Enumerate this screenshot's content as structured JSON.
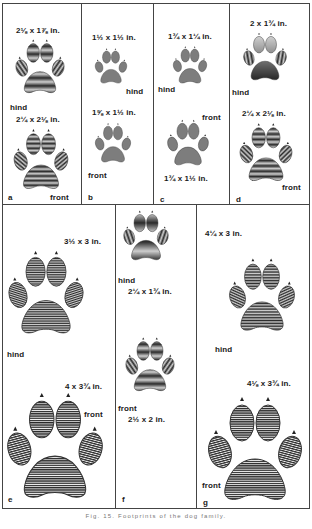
{
  "figure": {
    "caption": "Fig. 15.   Footprints of the dog family.",
    "panels": [
      {
        "id": "a",
        "letter": "a",
        "tracks": [
          {
            "which": "hind",
            "size": "2⅛ x 1⅞ in."
          },
          {
            "which": "front",
            "size": "2¼ x 2⅛ in."
          }
        ]
      },
      {
        "id": "b",
        "letter": "b",
        "tracks": [
          {
            "which": "hind",
            "size": "1½ x 1½ in."
          },
          {
            "which": "front",
            "size": "1⅝ x 1½ in."
          }
        ]
      },
      {
        "id": "c",
        "letter": "c",
        "tracks": [
          {
            "which": "hind",
            "size": "1¾ x 1¼ in."
          },
          {
            "which": "front",
            "size": "1¾ x 1½ in."
          }
        ]
      },
      {
        "id": "d",
        "letter": "d",
        "tracks": [
          {
            "which": "hind",
            "size": "2 x 1¾ in."
          },
          {
            "which": "front",
            "size": "2¼ x 2⅛ in."
          }
        ]
      },
      {
        "id": "e",
        "letter": "e",
        "tracks": [
          {
            "which": "hind",
            "size": "3½ x 3 in."
          },
          {
            "which": "front",
            "size": "4 x 3¾ in."
          }
        ]
      },
      {
        "id": "f",
        "letter": "f",
        "tracks": [
          {
            "which": "hind",
            "size": "2¼ x 1¾ in."
          },
          {
            "which": "front",
            "size": "2½ x 2 in."
          }
        ]
      },
      {
        "id": "g",
        "letter": "g",
        "tracks": [
          {
            "which": "hind",
            "size": "4¼ x 3 in."
          },
          {
            "which": "front",
            "size": "4⅛ x 3¾ in."
          }
        ]
      }
    ]
  }
}
